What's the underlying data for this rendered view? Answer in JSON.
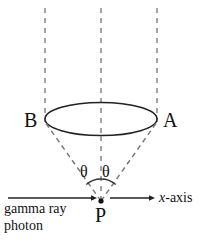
{
  "figure": {
    "colors": {
      "stroke": "#222222",
      "dashed_guide": "#8d8d8d",
      "dashed_cone": "#7a7a7a",
      "text": "#111111",
      "background": "#ffffff"
    },
    "labels": {
      "point_a": "A",
      "point_b": "B",
      "point_p": "P",
      "theta_left": "θ",
      "theta_right": "θ",
      "axis": "x",
      "axis_suffix": "-axis",
      "source_line1": "gamma ray",
      "source_line2": "photon"
    },
    "geometry": {
      "apex": {
        "x": 101,
        "y": 201
      },
      "ellipse": {
        "cx": 101,
        "cy": 119,
        "rx": 56,
        "ry": 16.5
      },
      "guide_lines_x": [
        45,
        101,
        157
      ],
      "guide_top_y": 8,
      "cone_left_end": {
        "x": 45,
        "y": 122
      },
      "cone_right_end": {
        "x": 157,
        "y": 122
      },
      "incoming_arrow": {
        "x1": 8,
        "y1": 198,
        "x2": 97,
        "y2": 198
      },
      "outgoing_arrow": {
        "x1": 108,
        "y1": 198,
        "x2": 155,
        "y2": 198
      },
      "angle_arc_radius": 22
    }
  }
}
